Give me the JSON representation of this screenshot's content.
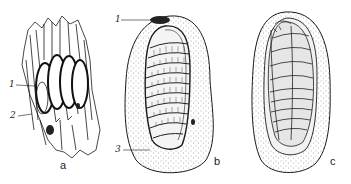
{
  "figure": {
    "panels": [
      {
        "id": "a",
        "label": "a",
        "callouts": [
          {
            "number": "1"
          },
          {
            "number": "2"
          }
        ]
      },
      {
        "id": "b",
        "label": "b",
        "callouts": [
          {
            "number": "1"
          },
          {
            "number": "3"
          }
        ]
      },
      {
        "id": "c",
        "label": "c",
        "callouts": []
      }
    ],
    "colors": {
      "ink": "#1a1a1a",
      "stipple": "#555555",
      "background": "#ffffff"
    }
  }
}
